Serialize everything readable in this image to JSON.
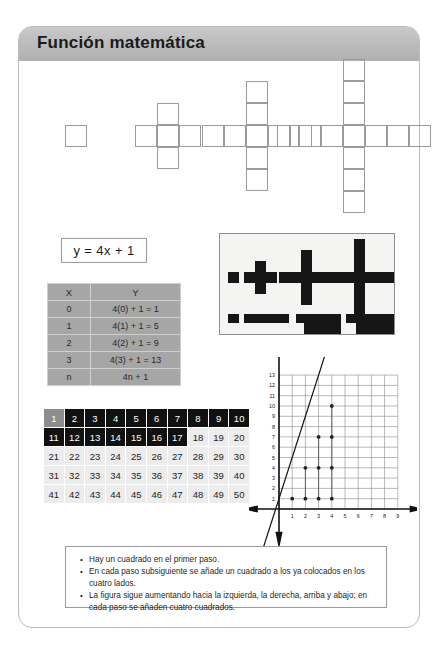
{
  "header": {
    "title": "Función matemática"
  },
  "equation": {
    "text": "y = 4x + 1"
  },
  "xy_table": {
    "headers": [
      "X",
      "Y"
    ],
    "rows": [
      [
        "0",
        "4(0) + 1 = 1"
      ],
      [
        "1",
        "4(1) + 1 = 5"
      ],
      [
        "2",
        "4(2) + 1 = 9"
      ],
      [
        "3",
        "4(3) + 1 = 13"
      ],
      [
        "n",
        "4n + 1"
      ]
    ]
  },
  "figures": {
    "caption": "step-growth cross figures",
    "steps": [
      {
        "label": "step-1",
        "squares": 1
      },
      {
        "label": "step-2",
        "squares": 5
      },
      {
        "label": "step-3",
        "squares": 9
      },
      {
        "label": "step-4",
        "squares": 13
      }
    ]
  },
  "photo": {
    "label": "black-cross-shapes-photo"
  },
  "number_grid": {
    "rows": [
      [
        "1",
        "2",
        "3",
        "4",
        "5",
        "6",
        "7",
        "8",
        "9",
        "10"
      ],
      [
        "11",
        "12",
        "13",
        "14",
        "15",
        "16",
        "17",
        "18",
        "19",
        "20"
      ],
      [
        "21",
        "22",
        "23",
        "24",
        "25",
        "26",
        "27",
        "28",
        "29",
        "30"
      ],
      [
        "31",
        "32",
        "33",
        "34",
        "35",
        "36",
        "37",
        "38",
        "39",
        "40"
      ],
      [
        "41",
        "42",
        "43",
        "44",
        "45",
        "46",
        "47",
        "48",
        "49",
        "50"
      ]
    ],
    "dark_cells": [
      "2",
      "3",
      "4",
      "5",
      "6",
      "7",
      "8",
      "9",
      "10",
      "11",
      "12",
      "13",
      "14",
      "15",
      "16",
      "17"
    ],
    "gray_cells": [
      "1"
    ]
  },
  "notes": {
    "items": [
      "Hay un cuadrado en el primer paso.",
      "En cada paso subsiguiente se añade un cuadrado a los ya colocados en los cuatro lados.",
      "La figura sigue aumentando hacia la izquierda, la derecha, arriba y abajo; en cada paso se añaden cuatro cuadrados."
    ]
  },
  "chart_data": {
    "type": "scatter",
    "title": "",
    "xlabel": "",
    "ylabel": "",
    "x_ticks": [
      1,
      2,
      3,
      4,
      5,
      6,
      7,
      8,
      9
    ],
    "y_ticks": [
      1,
      2,
      3,
      4,
      5,
      6,
      7,
      8,
      9,
      10,
      11,
      12,
      13
    ],
    "xlim": [
      0,
      9
    ],
    "ylim": [
      0,
      13
    ],
    "grid": true,
    "legend": "none",
    "series": [
      {
        "name": "y = 4x + 1",
        "type": "line",
        "x": [
          0,
          3.25
        ],
        "y": [
          1,
          14
        ]
      },
      {
        "name": "points",
        "type": "scatter",
        "x": [
          1,
          2,
          3,
          4,
          2,
          3,
          4,
          3,
          4,
          4
        ],
        "y": [
          1,
          1,
          1,
          1,
          4,
          4,
          4,
          7,
          7,
          10
        ]
      }
    ]
  },
  "colors": {
    "header_gray": "#bcbcbc",
    "table_gray": "#a6a6a6",
    "grid_dark": "#111111",
    "grid_light": "#ececec",
    "shape_black": "#161616"
  }
}
